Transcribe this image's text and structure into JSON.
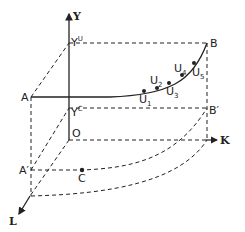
{
  "diagram": {
    "type": "3d-production-surface-sketch",
    "axes": {
      "y": {
        "label": "Y"
      },
      "k": {
        "label": "K"
      },
      "l": {
        "label": "L"
      },
      "origin": {
        "label": "O"
      }
    },
    "points": {
      "A": {
        "label": "A"
      },
      "B": {
        "label": "B"
      },
      "A_prime": {
        "label": "A′"
      },
      "B_prime": {
        "label": "B′"
      },
      "C": {
        "label": "C"
      },
      "Y_U": {
        "base": "Y",
        "sup": "U"
      },
      "Y_C": {
        "base": "Y",
        "sup": "C"
      }
    },
    "curve_points": [
      {
        "base": "U",
        "sub": "1"
      },
      {
        "base": "U",
        "sub": "2"
      },
      {
        "base": "U",
        "sub": "3"
      },
      {
        "base": "U",
        "sub": "4"
      },
      {
        "base": "U",
        "sub": "5"
      }
    ],
    "colors": {
      "line": "#222222",
      "background": "#ffffff"
    }
  }
}
